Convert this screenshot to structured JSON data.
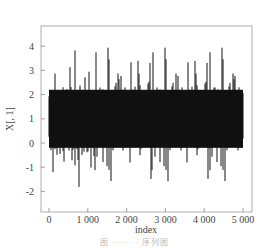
{
  "chart_data": {
    "type": "line",
    "title": "",
    "xlabel": "index",
    "ylabel": "X[, 1]",
    "xlim": [
      0,
      5000
    ],
    "ylim": [
      -2.8,
      4.6
    ],
    "x_ticks": [
      0,
      1000,
      2000,
      3000,
      4000,
      5000
    ],
    "x_tick_labels": [
      "0",
      "1 000",
      "2 000",
      "3 000",
      "4 000",
      "5 000"
    ],
    "y_ticks": [
      -2,
      -1,
      0,
      1,
      2,
      3,
      4
    ],
    "y_tick_labels": [
      "-2",
      "-1",
      "0",
      "1",
      "2",
      "3",
      "4"
    ],
    "grid": false,
    "legend": null,
    "series": [
      {
        "name": "X[, 1]",
        "description": "Dense time series of 5000 points fluctuating around mean ~1, typical range -1.5 to 3.5",
        "n_points": 5000,
        "mean": 1.0,
        "min": -2.4,
        "max": 4.5,
        "color": "#111111"
      }
    ]
  },
  "caption": {
    "text": "图 ·· ·· ·· 序列图"
  }
}
